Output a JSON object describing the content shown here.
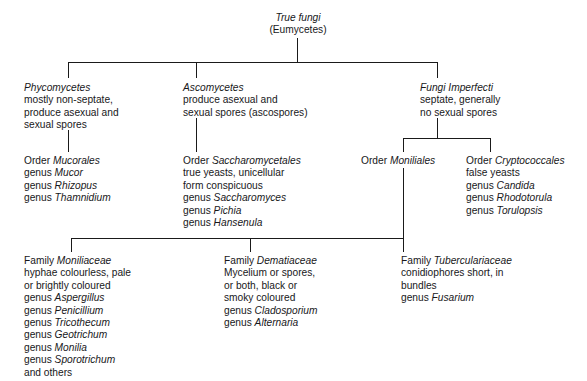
{
  "diagram": {
    "title_node": {
      "name": "True fungi",
      "subtitle": "(Eumycetes)"
    },
    "classes": [
      {
        "head": "Phycomycetes",
        "lines": [
          "mostly non-septate,",
          "produce asexual and",
          "sexual spores"
        ]
      },
      {
        "head": "Ascomycetes",
        "lines": [
          "produce asexual and",
          "sexual spores (ascospores)"
        ]
      },
      {
        "head": "Fungi Imperfecti",
        "lines": [
          "septate, generally",
          "no sexual spores"
        ]
      }
    ],
    "orders": [
      {
        "rank": "Order",
        "name": "Mucorales",
        "lines": [],
        "genera": [
          "Mucor",
          "Rhizopus",
          "Thamnidium"
        ],
        "genus_label": "genus"
      },
      {
        "rank": "Order",
        "name": "Saccharomycetales",
        "lines": [
          "true yeasts, unicellular",
          "form conspicuous"
        ],
        "genera": [
          "Saccharomyces",
          "Pichia",
          "Hansenula"
        ],
        "genus_label": "genus"
      },
      {
        "rank": "Order",
        "name": "Moniliales",
        "lines": [],
        "genera": [],
        "genus_label": "genus"
      },
      {
        "rank": "Order",
        "name": "Cryptococcales",
        "lines": [
          "false yeasts"
        ],
        "genera": [
          "Candida",
          "Rhodotorula",
          "Torulopsis"
        ],
        "genus_label": "genus"
      }
    ],
    "families": [
      {
        "rank": "Family",
        "name": "Moniliaceae",
        "lines": [
          "hyphae colourless, pale",
          "or brightly coloured"
        ],
        "genera": [
          "Aspergillus",
          "Penicillium",
          "Tricothecum",
          "Geotrichum",
          "Monilia",
          "Sporotrichum"
        ],
        "genus_label": "genus",
        "footer": "and others"
      },
      {
        "rank": "Family",
        "name": "Dematiaceae",
        "lines": [
          "Mycelium or spores,",
          "or both, black or",
          "smoky coloured"
        ],
        "genera": [
          "Cladosporium",
          "Alternaria"
        ],
        "genus_label": "genus",
        "footer": ""
      },
      {
        "rank": "Family",
        "name": "Tuberculariaceae",
        "lines": [
          "conidiophores short, in",
          "bundles"
        ],
        "genera": [
          "Fusarium"
        ],
        "genus_label": "genus",
        "footer": ""
      }
    ],
    "colors": {
      "line": "#1a1a1a",
      "text": "#18181a",
      "background": "#ffffff"
    }
  }
}
